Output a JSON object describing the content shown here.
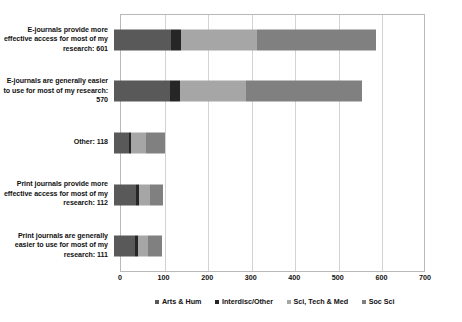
{
  "chart_data": {
    "type": "bar",
    "orientation": "horizontal",
    "stacked": true,
    "title": "",
    "subtitle": "",
    "xlabel": "",
    "ylabel": "",
    "xlim": [
      0,
      700
    ],
    "xticks": [
      0,
      100,
      200,
      300,
      400,
      500,
      600,
      700
    ],
    "xtick_labels": [
      "0",
      "100",
      "200",
      "300",
      "400",
      "500",
      "600",
      "700"
    ],
    "grid": true,
    "legend_position": "bottom",
    "categories": [
      "E-journals provide more effective access for most of my research: 601",
      "E-journals are generally easier to use for most of my research: 570",
      "Other: 118",
      "Print journals provide more effective access for most of my research: 112",
      "Print journals are generally easier to use for most of my research: 111"
    ],
    "category_totals": [
      601,
      570,
      118,
      112,
      111
    ],
    "series": [
      {
        "name": "Arts & Hum",
        "color": "#595959",
        "values": [
          130,
          128,
          35,
          50,
          48
        ]
      },
      {
        "name": "Interdisc/Other",
        "color": "#262626",
        "values": [
          24,
          24,
          4,
          7,
          7
        ]
      },
      {
        "name": "Sci, Tech & Med",
        "color": "#a6a6a6",
        "values": [
          175,
          152,
          35,
          25,
          22
        ]
      },
      {
        "name": "Soc Sci",
        "color": "#808080",
        "values": [
          272,
          266,
          44,
          30,
          34
        ]
      }
    ]
  },
  "legend": {
    "items": [
      {
        "label": "Arts & Hum"
      },
      {
        "label": "Interdisc/Other"
      },
      {
        "label": "Sci, Tech & Med"
      },
      {
        "label": "Soc Sci"
      }
    ]
  }
}
